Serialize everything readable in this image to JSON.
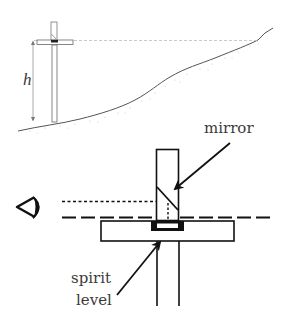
{
  "diagram": {
    "top_view": {
      "height_label": "h",
      "colors": {
        "ground": "#555555",
        "ground_stipple": "#bbbbbb",
        "sight_line": "#bbbbbb",
        "pole": "#666666"
      }
    },
    "detail_view": {
      "labels": {
        "mirror": "mirror",
        "spirit_line1": "spirit",
        "spirit_line2": "level"
      },
      "colors": {
        "stroke": "#111111",
        "text": "#3a3a3a"
      }
    }
  }
}
